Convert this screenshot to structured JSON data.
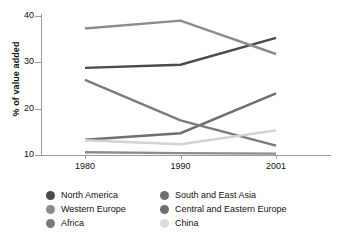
{
  "chart_data": {
    "type": "line",
    "title": "",
    "xlabel": "",
    "ylabel": "% of value added",
    "categories": [
      "1980",
      "1990",
      "2001"
    ],
    "x": [
      1980,
      1990,
      2001
    ],
    "ylim": [
      10,
      40
    ],
    "yticks": [
      10,
      20,
      30,
      40
    ],
    "grid": false,
    "legend_position": "bottom",
    "series": [
      {
        "name": "North America",
        "values": [
          28.8,
          29.5,
          35.3
        ],
        "color": "#4a4a4a"
      },
      {
        "name": "South and East Asia",
        "values": [
          13.3,
          14.7,
          23.3
        ],
        "color": "#6f6f6f"
      },
      {
        "name": "Western Europe",
        "values": [
          37.3,
          39.0,
          31.8
        ],
        "color": "#8c8c8c"
      },
      {
        "name": "Central and Eastern Europe",
        "values": [
          10.6,
          10.4,
          10.3
        ],
        "color": "#8c8c8c"
      },
      {
        "name": "Africa",
        "values": [
          26.2,
          17.5,
          12.0
        ],
        "color": "#7b7b7b"
      },
      {
        "name": "China",
        "values": [
          13.2,
          12.3,
          15.3
        ],
        "color": "#d2d2d2"
      }
    ]
  },
  "axis": {
    "y_title": "% of value added",
    "y_tick_labels": [
      "10",
      "20",
      "30",
      "40"
    ],
    "x_tick_labels": [
      "1980",
      "1990",
      "2001"
    ]
  },
  "legend": {
    "items": [
      {
        "label": "North America",
        "color": "#4a4a4a"
      },
      {
        "label": "South and East Asia",
        "color": "#6f6f6f"
      },
      {
        "label": "Western Europe",
        "color": "#8c8c8c"
      },
      {
        "label": "Central and Eastern Europe",
        "color": "#6f6f6f"
      },
      {
        "label": "Africa",
        "color": "#7b7b7b"
      },
      {
        "label": "China",
        "color": "#dcdcdc"
      }
    ]
  }
}
